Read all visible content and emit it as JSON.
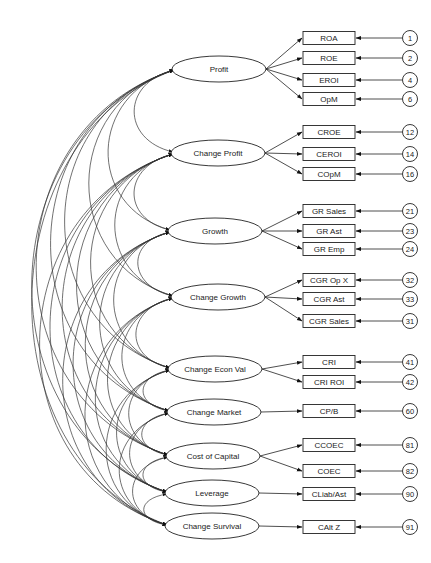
{
  "diagram": {
    "type": "structural-equation-model",
    "latent_factors": [
      {
        "label": "Profit",
        "cx": 219,
        "cy": 69,
        "rx": 47,
        "ry": 13,
        "indicators": [
          {
            "label": "ROA",
            "y": 38,
            "error": "1"
          },
          {
            "label": "ROE",
            "y": 58,
            "error": "2"
          },
          {
            "label": "EROI",
            "y": 80,
            "error": "4"
          },
          {
            "label": "OpM",
            "y": 99,
            "error": "6"
          }
        ]
      },
      {
        "label": "Change Profit",
        "cx": 218,
        "cy": 153,
        "rx": 47,
        "ry": 13,
        "indicators": [
          {
            "label": "CROE",
            "y": 132,
            "error": "12"
          },
          {
            "label": "CEROI",
            "y": 154,
            "error": "14"
          },
          {
            "label": "COpM",
            "y": 174,
            "error": "16"
          }
        ]
      },
      {
        "label": "Growth",
        "cx": 215,
        "cy": 231,
        "rx": 47,
        "ry": 13,
        "indicators": [
          {
            "label": "GR Sales",
            "y": 211,
            "error": "21"
          },
          {
            "label": "GR Ast",
            "y": 231,
            "error": "23"
          },
          {
            "label": "GR Emp",
            "y": 249,
            "error": "24"
          }
        ]
      },
      {
        "label": "Change Growth",
        "cx": 218,
        "cy": 297,
        "rx": 47,
        "ry": 13,
        "indicators": [
          {
            "label": "CGR Op X",
            "y": 280,
            "error": "32"
          },
          {
            "label": "CGR Ast",
            "y": 299,
            "error": "33"
          },
          {
            "label": "CGR Sales",
            "y": 321,
            "error": "31"
          }
        ]
      },
      {
        "label": "Change Econ Val",
        "cx": 215,
        "cy": 369,
        "rx": 47,
        "ry": 13,
        "indicators": [
          {
            "label": "CRI",
            "y": 362,
            "error": "41"
          },
          {
            "label": "CRI ROI",
            "y": 382,
            "error": "42"
          }
        ]
      },
      {
        "label": "Change Market",
        "cx": 214,
        "cy": 412,
        "rx": 47,
        "ry": 13,
        "indicators": [
          {
            "label": "CP/B",
            "y": 411,
            "error": "60"
          }
        ]
      },
      {
        "label": "Cost of Capital",
        "cx": 213,
        "cy": 456,
        "rx": 47,
        "ry": 13,
        "indicators": [
          {
            "label": "CCOEC",
            "y": 445,
            "error": "81"
          },
          {
            "label": "COEC",
            "y": 471,
            "error": "82"
          }
        ]
      },
      {
        "label": "Leverage",
        "cx": 212,
        "cy": 493,
        "rx": 47,
        "ry": 13,
        "indicators": [
          {
            "label": "CLiab/Ast",
            "y": 494,
            "error": "90"
          }
        ]
      },
      {
        "label": "Change Survival",
        "cx": 212,
        "cy": 526,
        "rx": 47,
        "ry": 13,
        "indicators": [
          {
            "label": "CAlt Z",
            "y": 527,
            "error": "91"
          }
        ]
      }
    ],
    "layout": {
      "box_x": 303,
      "box_w": 52,
      "box_h": 13,
      "circle_cx": 410,
      "circle_r": 7.5
    },
    "colors": {
      "stroke": "#222222",
      "background": "#ffffff"
    }
  }
}
